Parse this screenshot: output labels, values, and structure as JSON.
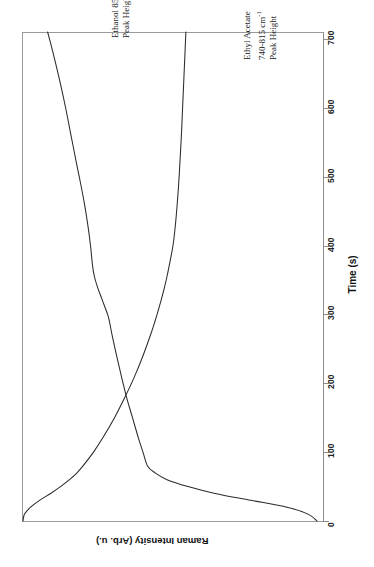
{
  "chart_data": {
    "type": "line",
    "title": "",
    "orientation": "rotated-90",
    "xlabel": "Time (s)",
    "ylabel": "Raman Intensity (Arb. u.)",
    "xlim": [
      0,
      720
    ],
    "ylim": [
      0,
      1
    ],
    "grid": false,
    "legend": "inline-annotations",
    "xticks": [
      0,
      100,
      200,
      300,
      400,
      500,
      600,
      700
    ],
    "xtick_labels": [
      "0",
      "100",
      "200",
      "300",
      "400",
      "500",
      "600",
      "700"
    ],
    "x": [
      0,
      10,
      20,
      30,
      40,
      50,
      60,
      70,
      80,
      100,
      120,
      150,
      180,
      210,
      240,
      270,
      290,
      300,
      320,
      340,
      355,
      370,
      400,
      430,
      460,
      490,
      520,
      560,
      600,
      640,
      680,
      710
    ],
    "series": [
      {
        "name": "Ethanol 850-915 cm-1 Peak Height",
        "label_lines": [
          "Ethanol 850-915 cm",
          "Peak Height"
        ],
        "values": [
          0.02,
          0.05,
          0.12,
          0.24,
          0.36,
          0.45,
          0.52,
          0.56,
          0.585,
          0.6,
          0.615,
          0.635,
          0.655,
          0.672,
          0.688,
          0.703,
          0.712,
          0.718,
          0.735,
          0.752,
          0.762,
          0.768,
          0.775,
          0.784,
          0.795,
          0.808,
          0.822,
          0.84,
          0.858,
          0.878,
          0.9,
          0.918
        ]
      },
      {
        "name": "Ethyl Acetate 740-815 cm-1 Peak Height",
        "label_lines": [
          "Ethyl Acetate",
          "740-815 cm",
          "Peak Height"
        ],
        "values": [
          1.0,
          0.995,
          0.975,
          0.945,
          0.908,
          0.875,
          0.845,
          0.82,
          0.8,
          0.765,
          0.735,
          0.695,
          0.66,
          0.628,
          0.6,
          0.575,
          0.56,
          0.553,
          0.54,
          0.528,
          0.52,
          0.513,
          0.5,
          0.492,
          0.486,
          0.481,
          0.477,
          0.472,
          0.468,
          0.464,
          0.46,
          0.457
        ]
      }
    ],
    "annotations": [
      {
        "name": "ethanol-annotation",
        "line1": "Ethanol 850-915 cm",
        "sup1": "-1",
        "line2": "Peak Height"
      },
      {
        "name": "ethyl-acetate-annotation",
        "line1": "Ethyl Acetate",
        "line2": "740-815 cm",
        "sup2": "-1",
        "line3": "Peak Height"
      }
    ],
    "colors": {
      "curve": "#2b2b2b",
      "axis": "#8c8c8c",
      "frame": "#9a9a9a",
      "text": "#1a1a1a",
      "background": "#ffffff"
    }
  },
  "axis": {
    "x_title": "Time (s)",
    "y_title": "Raman Intensity (Arb. u.)",
    "ticks": [
      "0",
      "100",
      "200",
      "300",
      "400",
      "500",
      "600",
      "700"
    ]
  }
}
